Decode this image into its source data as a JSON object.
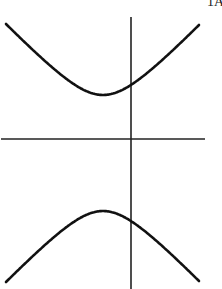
{
  "figure": {
    "corner_label": "1A",
    "colors": {
      "background": "#ffffff",
      "stroke": "#111111",
      "axis": "#222222"
    },
    "axes": {
      "x_axis": {
        "x1": 1,
        "y1": 139,
        "x2": 205,
        "y2": 139
      },
      "y_axis": {
        "x1": 131,
        "y1": 17,
        "x2": 131,
        "y2": 289
      }
    },
    "curves": {
      "upper_branch": {
        "start": [
          6,
          24
        ],
        "vertex": [
          103,
          95
        ],
        "end": [
          199,
          23
        ]
      },
      "lower_branch": {
        "start": [
          6,
          282
        ],
        "vertex": [
          103,
          211
        ],
        "end": [
          199,
          282
        ]
      }
    }
  }
}
